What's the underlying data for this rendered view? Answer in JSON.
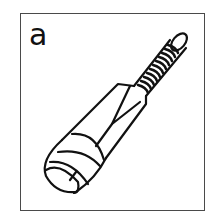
{
  "card": {
    "letter": "a",
    "illustration": "cricket-bat-icon",
    "border_color": "#4a4a4a",
    "line_color": "#111111"
  }
}
